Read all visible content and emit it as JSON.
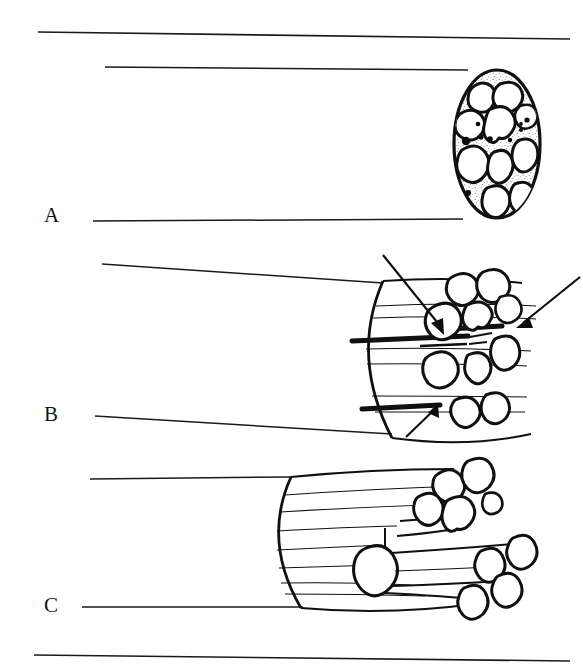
{
  "figure": {
    "type": "anatomical-line-diagram",
    "background_color": "#ffffff",
    "ink_color": "#101010",
    "width": 583,
    "height": 672,
    "panel_count": 3
  },
  "panels": [
    {
      "id": "A",
      "label": "A",
      "label_x": 44,
      "label_y": 205,
      "view": "cross-section",
      "description": "Oval nerve cross-section containing fascicles in stippled matrix with small dark dots",
      "leader_lines": [
        {
          "name": "leader-a-top",
          "x1": 105,
          "y1": 67,
          "x2": 468,
          "y2": 70
        },
        {
          "name": "leader-a-bottom",
          "x1": 93,
          "y1": 221,
          "x2": 463,
          "y2": 219
        }
      ],
      "shape": {
        "ellipse_cx": 497,
        "ellipse_cy": 144,
        "ellipse_rx": 43,
        "ellipse_ry": 74
      },
      "fascicle_count": 13,
      "dot_count": 9
    },
    {
      "id": "B",
      "label": "B",
      "label_x": 44,
      "label_y": 404,
      "view": "three-quarter cut cylinder",
      "description": "Nerve trunk cylinder with cut face, emerging fascicles and dark longitudinal vessels; three arrows indicate structures",
      "leader_lines": [
        {
          "name": "leader-b-top",
          "x1": 102,
          "y1": 264,
          "x2": 383,
          "y2": 283
        },
        {
          "name": "leader-b-bottom",
          "x1": 95,
          "y1": 416,
          "x2": 392,
          "y2": 434
        }
      ],
      "arrows": [
        {
          "name": "arrow-epineurium",
          "from_x": 383,
          "from_y": 255,
          "to_x": 444,
          "to_y": 333
        },
        {
          "name": "arrow-vessel-right",
          "from_x": 580,
          "from_y": 277,
          "to_x": 519,
          "to_y": 326
        },
        {
          "name": "arrow-vessel-lower",
          "from_x": 406,
          "from_y": 437,
          "to_x": 437,
          "to_y": 406
        }
      ],
      "vessel_count": 4,
      "fascicle_count": 11
    },
    {
      "id": "C",
      "label": "C",
      "label_x": 44,
      "label_y": 595,
      "view": "three-quarter cut cylinder with division",
      "description": "Nerve trunk dividing into an upper fascicle group and a lower fascicle group",
      "leader_lines": [
        {
          "name": "leader-c-top",
          "x1": 90,
          "y1": 479,
          "x2": 291,
          "y2": 477
        },
        {
          "name": "leader-c-bottom",
          "x1": 82,
          "y1": 607,
          "x2": 303,
          "y2": 607
        }
      ],
      "upper_group_fascicles": 5,
      "lower_group_fascicles": 5
    }
  ],
  "rules": [
    {
      "name": "top-rule",
      "x1": 38,
      "y1": 32,
      "x2": 570,
      "y2": 39
    },
    {
      "name": "bottom-rule",
      "x1": 34,
      "y1": 655,
      "x2": 570,
      "y2": 661
    }
  ]
}
